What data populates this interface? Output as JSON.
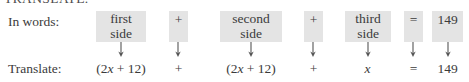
{
  "header": {
    "clipped_text": "TRANSLATE."
  },
  "figure": {
    "row_labels": {
      "words": "In words:",
      "translate": "Translate:"
    },
    "columns": [
      {
        "id": "first-side",
        "words_lines": [
          "first",
          "side"
        ],
        "expression": "(2x + 12)",
        "kind": "term"
      },
      {
        "id": "plus-1",
        "words_lines": [
          "+"
        ],
        "expression": "+",
        "kind": "operator"
      },
      {
        "id": "second-side",
        "words_lines": [
          "second",
          "side"
        ],
        "expression": "(2x + 12)",
        "kind": "term"
      },
      {
        "id": "plus-2",
        "words_lines": [
          "+"
        ],
        "expression": "+",
        "kind": "operator"
      },
      {
        "id": "third-side",
        "words_lines": [
          "third",
          "side"
        ],
        "expression": "x",
        "kind": "term"
      },
      {
        "id": "equals",
        "words_lines": [
          "="
        ],
        "expression": "=",
        "kind": "operator"
      },
      {
        "id": "total",
        "words_lines": [
          "149"
        ],
        "expression": "149",
        "kind": "term"
      }
    ],
    "arrow_glyph": "down-arrow",
    "highlight_color": "#e4e4e4",
    "text_color": "#3b3b3b"
  }
}
